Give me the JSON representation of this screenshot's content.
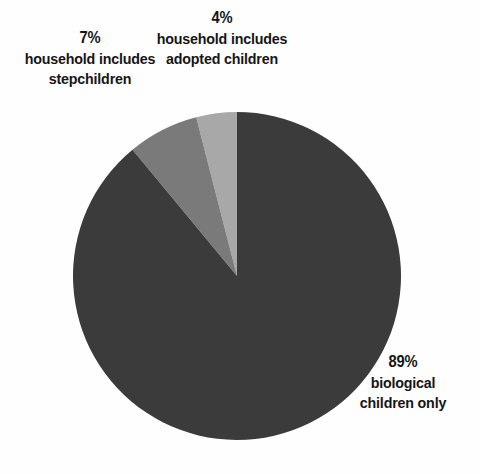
{
  "chart_data": {
    "type": "pie",
    "title": "",
    "subtitle": "",
    "xlabel": "",
    "ylabel": "",
    "legend_position": "none",
    "grid": false,
    "unit": "%",
    "total": 100,
    "categories": [
      "biological children only",
      "household includes stepchildren",
      "household includes adopted children"
    ],
    "values": [
      89,
      7,
      4
    ],
    "slices": [
      {
        "id": "adopted",
        "percent_label": "4%",
        "value": 4,
        "description_line_1": "household includes",
        "description_line_2": "adopted children",
        "color": "#a8a8a8",
        "start_angle_deg": 0,
        "end_angle_deg": 14.4
      },
      {
        "id": "stepchildren",
        "percent_label": "7%",
        "value": 7,
        "description_line_1": "household includes",
        "description_line_2": "stepchildren",
        "color": "#7a7a7a",
        "start_angle_deg": 14.4,
        "end_angle_deg": 39.6
      },
      {
        "id": "biological",
        "percent_label": "89%",
        "value": 89,
        "description_line_1": "biological",
        "description_line_2": "children only",
        "color": "#3b3b3b",
        "start_angle_deg": 39.6,
        "end_angle_deg": 360
      }
    ],
    "geometry": {
      "center_x": 237,
      "center_y": 276,
      "radius": 164,
      "direction": "counter-clockwise",
      "start_at": "12 o'clock"
    },
    "colors": {
      "background": "#fefefe",
      "text": "#151515",
      "slice_biological": "#3b3b3b",
      "slice_stepchildren": "#7a7a7a",
      "slice_adopted": "#a8a8a8"
    }
  }
}
